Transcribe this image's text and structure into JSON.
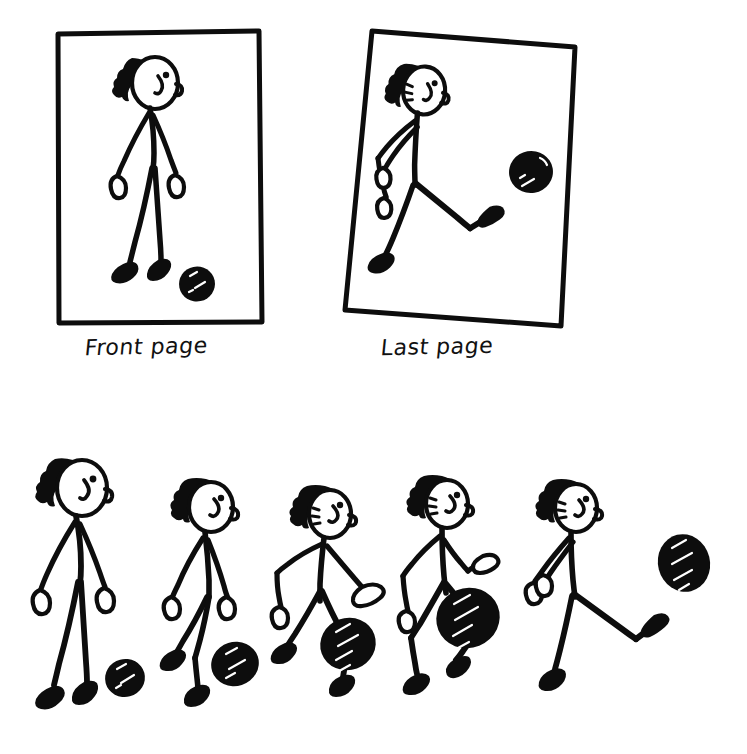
{
  "illustration": {
    "title": "Stick figure kicking a ball - flipbook illustration",
    "background_color": "#ffffff",
    "ink_color": "#0d0d0d",
    "highlight_color": "#ffffff",
    "width": 747,
    "height": 754
  },
  "panels": [
    {
      "id": "front-page",
      "caption": "Front page",
      "frame": {
        "x": 57,
        "y": 32,
        "width": 205,
        "height": 291,
        "rotation_deg": 0.4
      },
      "caption_pos": {
        "x": 85,
        "y": 337
      },
      "figure_pose": "standing-upright-arms-down",
      "ball": {
        "cx": 197,
        "cy": 284,
        "r": 18,
        "state": "at-rest-on-ground"
      }
    },
    {
      "id": "last-page",
      "caption": "Last page",
      "frame": {
        "x": 345,
        "y": 28,
        "width": 203,
        "height": 298,
        "rotation_deg": 4.5
      },
      "caption_pos": {
        "x": 381,
        "y": 337
      },
      "figure_pose": "kicking-leg-extended-follow-through",
      "ball": {
        "cx": 531,
        "cy": 172,
        "r": 22,
        "state": "in-flight"
      }
    }
  ],
  "sequence": {
    "label": "kick animation sequence",
    "frame_count": 5,
    "frames": [
      {
        "index": 1,
        "pose": "standing-upright",
        "ball": {
          "cx": 125,
          "cy": 678,
          "r": 20,
          "state": "at-rest"
        }
      },
      {
        "index": 2,
        "pose": "leaning-step-forward",
        "ball": {
          "cx": 235,
          "cy": 664,
          "r": 24,
          "state": "at-rest"
        }
      },
      {
        "index": 3,
        "pose": "leaning-more-arms-swinging",
        "ball": {
          "cx": 348,
          "cy": 644,
          "r": 28,
          "state": "about-to-be-struck"
        }
      },
      {
        "index": 4,
        "pose": "knee-raised-striking-ball",
        "ball": {
          "cx": 468,
          "cy": 618,
          "r": 32,
          "state": "being-struck"
        }
      },
      {
        "index": 5,
        "pose": "leg-extended-follow-through",
        "ball": {
          "cx": 684,
          "cy": 563,
          "r": 26,
          "state": "in-flight"
        }
      }
    ]
  }
}
